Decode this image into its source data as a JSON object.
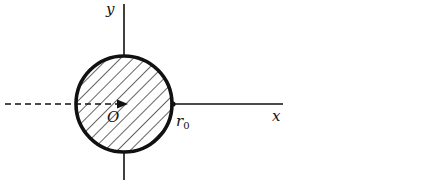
{
  "diagram": {
    "labels": {
      "y_axis": "y",
      "x_axis": "x",
      "origin": "O",
      "radius": "r",
      "radius_sub": "0"
    },
    "colors": {
      "ink": "#111111",
      "background": "#ffffff"
    },
    "elements": [
      "y-axis",
      "x-axis",
      "hatched-disk",
      "dashed-line-to-origin",
      "arrow-to-origin",
      "boundary-point-r0"
    ]
  }
}
